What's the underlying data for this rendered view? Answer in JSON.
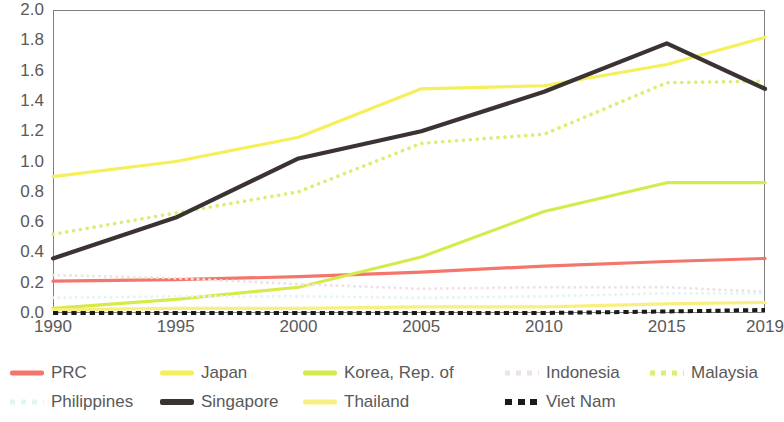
{
  "chart_data": {
    "type": "line",
    "title": "",
    "subtitle": "",
    "xlabel": "",
    "ylabel": "",
    "xlim": [
      1990,
      2019
    ],
    "ylim": [
      0.0,
      2.0
    ],
    "grid": false,
    "legend_position": "bottom",
    "x": [
      1990,
      1995,
      2000,
      2005,
      2010,
      2015,
      2019
    ],
    "xticks": [
      "1990",
      "1995",
      "2000",
      "2005",
      "2010",
      "2015",
      "2019"
    ],
    "yticks": [
      "0.0",
      "0.2",
      "0.4",
      "0.6",
      "0.8",
      "1.0",
      "1.2",
      "1.4",
      "1.6",
      "1.8",
      "2.0"
    ],
    "ytick_values": [
      0.0,
      0.2,
      0.4,
      0.6,
      0.8,
      1.0,
      1.2,
      1.4,
      1.6,
      1.8,
      2.0
    ],
    "series": [
      {
        "name": "PRC",
        "color": "#F4766A",
        "style": "solid",
        "width": 3.2,
        "values": [
          0.21,
          0.22,
          0.24,
          0.27,
          0.31,
          0.34,
          0.36
        ]
      },
      {
        "name": "Japan",
        "color": "#F5F05A",
        "style": "solid",
        "width": 3.2,
        "values": [
          0.9,
          1.0,
          1.16,
          1.48,
          1.5,
          1.64,
          1.82
        ]
      },
      {
        "name": "Korea, Rep. of",
        "color": "#D6EB4B",
        "style": "solid",
        "width": 3.2,
        "values": [
          0.03,
          0.09,
          0.17,
          0.37,
          0.67,
          0.86,
          0.86
        ]
      },
      {
        "name": "Indonesia",
        "color": "#EFE2E4",
        "style": "dotted",
        "width": 3.0,
        "values": [
          0.25,
          0.23,
          0.19,
          0.16,
          0.17,
          0.17,
          0.14
        ]
      },
      {
        "name": "Malaysia",
        "color": "#DCEE72",
        "style": "dotted",
        "width": 3.6,
        "values": [
          0.52,
          0.66,
          0.8,
          1.12,
          1.18,
          1.52,
          1.53
        ]
      },
      {
        "name": "Philippines",
        "color": "#E2F5F2",
        "style": "dotted",
        "width": 3.0,
        "values": [
          0.1,
          0.11,
          0.11,
          0.1,
          0.11,
          0.13,
          0.13
        ]
      },
      {
        "name": "Singapore",
        "color": "#3B3331",
        "style": "solid",
        "width": 4.2,
        "values": [
          0.36,
          0.63,
          1.02,
          1.2,
          1.46,
          1.78,
          1.48
        ]
      },
      {
        "name": "Thailand",
        "color": "#F7F080",
        "style": "solid",
        "width": 3.2,
        "values": [
          0.02,
          0.03,
          0.03,
          0.04,
          0.04,
          0.06,
          0.07
        ]
      },
      {
        "name": "Viet Nam",
        "color": "#1A1A1A",
        "style": "dashed",
        "width": 4.0,
        "values": [
          0.0,
          0.0,
          0.0,
          0.0,
          0.0,
          0.01,
          0.02
        ]
      }
    ]
  },
  "axes": {
    "y_ticks": [
      "2.0",
      "1.8",
      "1.6",
      "1.4",
      "1.2",
      "1.0",
      "0.8",
      "0.6",
      "0.4",
      "0.2",
      "0.0"
    ],
    "x_ticks": [
      "1990",
      "1995",
      "2000",
      "2005",
      "2010",
      "2015",
      "2019"
    ],
    "axis_color": "#7f7f7f"
  },
  "legend": {
    "rows": [
      [
        {
          "label": "PRC",
          "color": "#F4766A",
          "style": "solid",
          "x": 10,
          "width": 34,
          "height": 5
        },
        {
          "label": "Japan",
          "color": "#F5F05A",
          "style": "solid",
          "x": 160,
          "width": 34,
          "height": 5
        },
        {
          "label": "Korea, Rep. of",
          "color": "#D6EB4B",
          "style": "solid",
          "x": 303,
          "width": 34,
          "height": 5
        },
        {
          "label": "Indonesia",
          "color": "#EFE2E4",
          "style": "dotted",
          "x": 505,
          "width": 34,
          "height": 5
        },
        {
          "label": "Malaysia",
          "color": "#DCEE72",
          "style": "dotted",
          "x": 650,
          "width": 34,
          "height": 5
        }
      ],
      [
        {
          "label": "Philippines",
          "color": "#E2F5F2",
          "style": "dotted",
          "x": 10,
          "width": 34,
          "height": 5
        },
        {
          "label": "Singapore",
          "color": "#3B3331",
          "style": "solid",
          "x": 160,
          "width": 34,
          "height": 6
        },
        {
          "label": "Thailand",
          "color": "#F7F080",
          "style": "solid",
          "x": 303,
          "width": 34,
          "height": 5
        },
        {
          "label": "Viet Nam",
          "color": "#1A1A1A",
          "style": "dashed",
          "x": 505,
          "width": 34,
          "height": 6
        }
      ]
    ]
  }
}
